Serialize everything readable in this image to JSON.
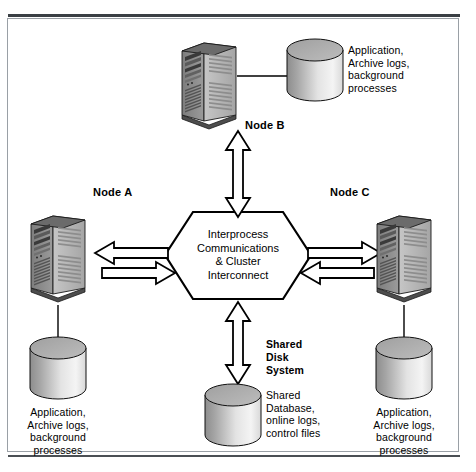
{
  "diagram": {
    "hexagon": {
      "name": "interprocess-communications-hexagon",
      "lines": [
        "Interprocess",
        "Communications",
        "& Cluster",
        "Interconnect"
      ],
      "text": "Interprocess Communications & Cluster Interconnect"
    },
    "nodes": [
      {
        "id": "node-b",
        "label": "Node B",
        "disk_caption_lines": [
          "Application,",
          "Archive logs,",
          "background",
          "processes"
        ],
        "disk_caption": "Application, Archive logs, background processes"
      },
      {
        "id": "node-a",
        "label": "Node A",
        "disk_caption_lines": [
          "Application,",
          "Archive logs,",
          "background",
          "processes"
        ],
        "disk_caption": "Application, Archive logs, background processes"
      },
      {
        "id": "node-c",
        "label": "Node C",
        "disk_caption_lines": [
          "Application,",
          "Archive logs,",
          "background",
          "processes"
        ],
        "disk_caption": "Application, Archive logs, background processes"
      }
    ],
    "shared_disk": {
      "heading_lines": [
        "Shared",
        "Disk",
        "System"
      ],
      "heading": "Shared Disk System",
      "caption_lines": [
        "Shared",
        "Database,",
        "online logs,",
        "control files"
      ],
      "caption": "Shared Database, online logs, control files"
    },
    "colors": {
      "outline": "#000000",
      "rule": "#3a3f44",
      "frame_border": "#9aa0a6",
      "disk_top": "#9c9c9c",
      "disk_body_dark": "#8a8a8a",
      "disk_body_light": "#f2f2f2",
      "server_front": "#8f8f8f",
      "server_side": "#c9c9c9",
      "server_top": "#6f6f6f",
      "arrow_fill": "#ffffff",
      "background": "#ffffff"
    }
  }
}
